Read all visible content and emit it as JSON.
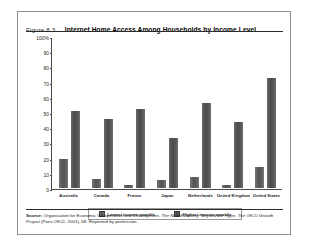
{
  "figure": {
    "number": "Figure 8.3",
    "title": "Internet Home Access Among Households by Income Level"
  },
  "source": {
    "label": "Source:",
    "part1": "Organisation for Economic Co-operation and Development,",
    "italic1": "The New Economy: Beyond the Hype. The",
    "smallcaps1": "OECD",
    "italic2": "Growth Project",
    "part2": "(Paris:",
    "smallcaps2": "OECD",
    "part3": ", 2001), 68. Reprinted by permission."
  },
  "chart_data": {
    "type": "bar",
    "title": "Internet Home Access Among Households by Income Level",
    "xlabel": "",
    "ylabel": "",
    "ylim": [
      0,
      100
    ],
    "yticks": [
      "100%",
      "90",
      "80",
      "70",
      "60",
      "50",
      "40",
      "30",
      "20",
      "10",
      "0"
    ],
    "ytick_values": [
      100,
      90,
      80,
      70,
      60,
      50,
      40,
      30,
      20,
      10,
      0
    ],
    "grid": false,
    "legend_position": "bottom",
    "categories": [
      "Australia",
      "Canada",
      "France",
      "Japan",
      "Netherlands",
      "United Kingdom",
      "United States"
    ],
    "series": [
      {
        "name": "Lowest income quartile",
        "color": "#555555",
        "values": [
          19,
          6,
          2,
          5,
          7,
          2,
          14
        ]
      },
      {
        "name": "Highest income quartile",
        "color": "#4b4b4b",
        "values": [
          51,
          46,
          52,
          33,
          56,
          44,
          73
        ]
      }
    ]
  }
}
